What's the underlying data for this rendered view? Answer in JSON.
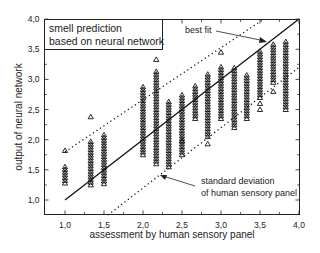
{
  "chart_data": {
    "type": "scatter",
    "title": "",
    "legend_box": [
      "smell prediction",
      "based on neural network"
    ],
    "xlabel": "assessment by human sensory panel",
    "ylabel": "output of neural network",
    "xlim": [
      0.75,
      4.0
    ],
    "ylim": [
      0.75,
      4.0
    ],
    "xticks": [
      "1,0",
      "1,5",
      "2,0",
      "2,5",
      "3,0",
      "3,5",
      "4,0"
    ],
    "yticks": [
      "1,0",
      "1,5",
      "2,0",
      "2,5",
      "3,0",
      "3,5",
      "4,0"
    ],
    "grid": false,
    "marker": "open-triangle",
    "annotations": [
      {
        "text": "best fit",
        "points_to": "solid line near (3.4, 3.4)"
      },
      {
        "text": "standard deviation",
        "text2": "of human sensory panel",
        "points_to": "lower dotted line near (2.2, 1.45)"
      }
    ],
    "lines": [
      {
        "name": "best fit",
        "style": "solid",
        "from": [
          1.0,
          1.0
        ],
        "to": [
          4.0,
          4.0
        ]
      },
      {
        "name": "upper std dev",
        "style": "dotted",
        "from": [
          1.0,
          1.8
        ],
        "to": [
          3.55,
          4.0
        ]
      },
      {
        "name": "lower std dev",
        "style": "dotted",
        "from": [
          1.55,
          0.75
        ],
        "to": [
          4.0,
          3.2
        ]
      }
    ],
    "series": [
      {
        "name": "columns",
        "points": [
          {
            "x": 1.0,
            "min": 1.28,
            "max": 1.58,
            "outliers": [
              1.82
            ]
          },
          {
            "x": 1.33,
            "min": 1.25,
            "max": 1.97,
            "outliers": [
              2.38
            ]
          },
          {
            "x": 1.5,
            "min": 1.27,
            "max": 2.12,
            "outliers": []
          },
          {
            "x": 2.0,
            "min": 1.75,
            "max": 2.88,
            "outliers": []
          },
          {
            "x": 2.17,
            "min": 1.6,
            "max": 3.15,
            "outliers": [
              3.33
            ]
          },
          {
            "x": 2.33,
            "min": 1.55,
            "max": 2.65,
            "outliers": []
          },
          {
            "x": 2.5,
            "min": 1.75,
            "max": 2.78,
            "outliers": [
              1.98
            ]
          },
          {
            "x": 2.67,
            "min": 2.35,
            "max": 2.9,
            "outliers": []
          },
          {
            "x": 2.83,
            "min": 2.05,
            "max": 3.12,
            "outliers": [
              1.93
            ]
          },
          {
            "x": 3.0,
            "min": 2.35,
            "max": 3.22,
            "outliers": [
              3.45
            ]
          },
          {
            "x": 3.17,
            "min": 2.2,
            "max": 3.2,
            "outliers": []
          },
          {
            "x": 3.33,
            "min": 2.35,
            "max": 3.1,
            "outliers": []
          },
          {
            "x": 3.5,
            "min": 2.7,
            "max": 3.5,
            "outliers": [
              2.6,
              2.5
            ]
          },
          {
            "x": 3.67,
            "min": 2.95,
            "max": 3.6,
            "outliers": [
              2.8
            ]
          },
          {
            "x": 3.83,
            "min": 2.5,
            "max": 3.65,
            "outliers": []
          }
        ]
      }
    ]
  }
}
